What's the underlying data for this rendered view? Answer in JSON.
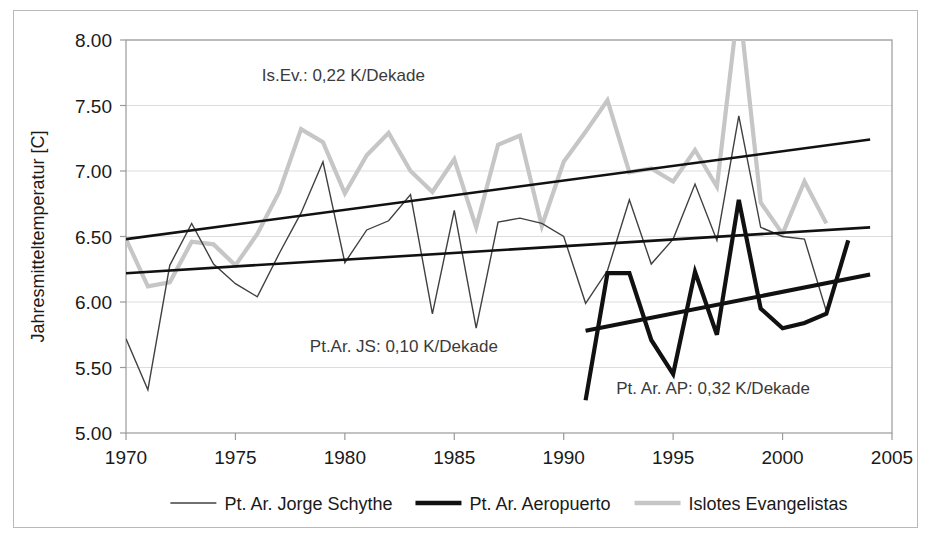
{
  "chart_data": {
    "type": "line",
    "title": "",
    "xlabel": "",
    "ylabel": "Jahresmitteltemperatur [C]",
    "xlim": [
      1970,
      2005
    ],
    "ylim": [
      5.0,
      8.0
    ],
    "grid": true,
    "legend_position": "bottom",
    "xticks": [
      "1970",
      "1975",
      "1980",
      "1985",
      "1990",
      "1995",
      "2000",
      "2005"
    ],
    "yticks": [
      "5.00",
      "5.50",
      "6.00",
      "6.50",
      "7.00",
      "7.50",
      "8.00"
    ],
    "series": [
      {
        "name": "Pt. Ar. Jorge Schythe",
        "color": "#404040",
        "width": 1.4,
        "x": [
          1970,
          1971,
          1972,
          1973,
          1974,
          1975,
          1976,
          1977,
          1978,
          1979,
          1980,
          1981,
          1982,
          1983,
          1984,
          1985,
          1986,
          1987,
          1988,
          1989,
          1990,
          1991,
          1992,
          1993,
          1994,
          1995,
          1996,
          1997,
          1998,
          1999,
          2000,
          2001,
          2002,
          2003
        ],
        "y": [
          5.72,
          5.33,
          6.28,
          6.6,
          6.29,
          6.14,
          6.04,
          6.37,
          6.68,
          7.07,
          6.3,
          6.55,
          6.62,
          6.82,
          5.91,
          6.7,
          5.8,
          6.61,
          6.64,
          6.6,
          6.5,
          5.99,
          6.24,
          6.78,
          6.29,
          6.48,
          6.9,
          6.47,
          7.42,
          6.57,
          6.5,
          6.48,
          5.93,
          6.47
        ]
      },
      {
        "name": "Pt. Ar. Aeropuerto",
        "color": "#111111",
        "width": 4.2,
        "x": [
          1991,
          1992,
          1993,
          1994,
          1995,
          1996,
          1997,
          1998,
          1999,
          2000,
          2001,
          2002,
          2003
        ],
        "y": [
          5.25,
          6.22,
          6.22,
          5.71,
          5.45,
          6.23,
          5.75,
          6.78,
          5.95,
          5.8,
          5.84,
          5.91,
          6.47
        ]
      },
      {
        "name": "Islotes Evangelistas",
        "color": "#c6c6c6",
        "width": 4.2,
        "x": [
          1970,
          1971,
          1972,
          1973,
          1974,
          1975,
          1976,
          1977,
          1978,
          1979,
          1980,
          1981,
          1982,
          1983,
          1984,
          1985,
          1986,
          1987,
          1988,
          1989,
          1990,
          1991,
          1992,
          1993,
          1994,
          1995,
          1996,
          1997,
          1998,
          1999,
          2000,
          2001,
          2002
        ],
        "y": [
          6.48,
          6.12,
          6.15,
          6.46,
          6.44,
          6.28,
          6.52,
          6.84,
          7.32,
          7.22,
          6.83,
          7.12,
          7.29,
          7.0,
          6.84,
          7.09,
          6.57,
          7.2,
          7.27,
          6.58,
          7.07,
          7.3,
          7.54,
          6.99,
          7.02,
          6.92,
          7.16,
          6.88,
          8.3,
          6.76,
          6.52,
          6.92,
          6.6
        ]
      }
    ],
    "trendlines": [
      {
        "name": "islotes-trend",
        "x": [
          1970,
          2004
        ],
        "y": [
          6.48,
          7.24
        ],
        "color": "#111111",
        "width": 2.6
      },
      {
        "name": "jorge-schythe-trend",
        "x": [
          1970,
          2004
        ],
        "y": [
          6.22,
          6.57
        ],
        "color": "#111111",
        "width": 2.6
      },
      {
        "name": "aeropuerto-trend",
        "x": [
          1991,
          2004
        ],
        "y": [
          5.78,
          6.21
        ],
        "color": "#111111",
        "width": 4.0
      }
    ],
    "annotations": [
      {
        "name": "islotes-slope-annotation",
        "text": "Is.Ev.:  0,22 K/Dekade",
        "x": 1976.2,
        "y": 7.69
      },
      {
        "name": "jorge-schythe-slope-annotation",
        "text": "Pt.Ar. JS: 0,10 K/Dekade",
        "x": 1978.4,
        "y": 5.62
      },
      {
        "name": "aeropuerto-slope-annotation",
        "text": "Pt. Ar. AP:  0,32 K/Dekade",
        "x": 1992.4,
        "y": 5.3
      }
    ]
  },
  "legend": {
    "items": [
      {
        "label": "Pt. Ar. Jorge Schythe",
        "color": "#404040",
        "width": 1.4
      },
      {
        "label": "Pt. Ar. Aeropuerto",
        "color": "#111111",
        "width": 4.6
      },
      {
        "label": "Islotes Evangelistas",
        "color": "#c6c6c6",
        "width": 4.6
      }
    ]
  }
}
